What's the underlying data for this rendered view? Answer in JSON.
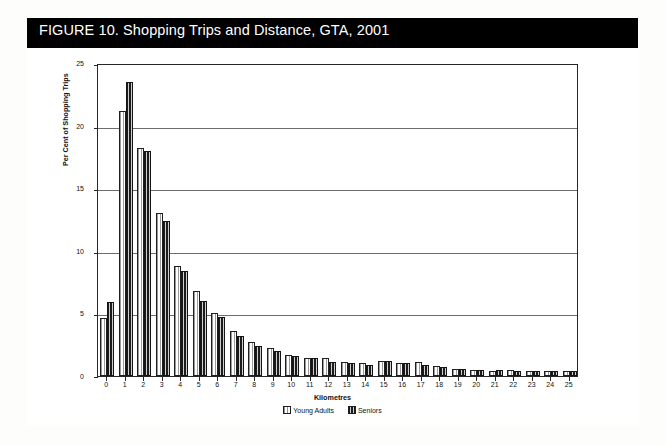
{
  "figure": {
    "title": "FIGURE 10. Shopping Trips and Distance, GTA, 2001"
  },
  "chart_data": {
    "type": "bar",
    "title": "FIGURE 10. Shopping Trips and Distance, GTA, 2001",
    "xlabel": "Kilometres",
    "ylabel": "Per Cent of Shopping Trips",
    "categories": [
      "0",
      "1",
      "2",
      "3",
      "4",
      "5",
      "6",
      "7",
      "8",
      "9",
      "10",
      "11",
      "12",
      "13",
      "14",
      "15",
      "16",
      "17",
      "18",
      "19",
      "20",
      "21",
      "22",
      "23",
      "24",
      "25"
    ],
    "ylim": [
      0,
      25
    ],
    "yticks": [
      0,
      5,
      10,
      15,
      20,
      25
    ],
    "grid": true,
    "legend_position": "bottom",
    "series": [
      {
        "name": "Young Adults",
        "color": "#ededed",
        "values": [
          4.6,
          21.2,
          18.2,
          13.0,
          8.8,
          6.8,
          5.0,
          3.6,
          2.7,
          2.2,
          1.7,
          1.4,
          1.4,
          1.1,
          1.0,
          1.2,
          1.0,
          1.1,
          0.8,
          0.6,
          0.5,
          0.4,
          0.5,
          0.4,
          0.4,
          0.4
        ]
      },
      {
        "name": "Seniors",
        "color": "#3d3d3d",
        "values": [
          5.9,
          23.5,
          18.0,
          12.4,
          8.4,
          6.0,
          4.7,
          3.2,
          2.4,
          2.0,
          1.6,
          1.4,
          1.1,
          1.0,
          0.9,
          1.2,
          1.0,
          0.9,
          0.7,
          0.6,
          0.5,
          0.5,
          0.4,
          0.4,
          0.4,
          0.4
        ]
      }
    ]
  }
}
